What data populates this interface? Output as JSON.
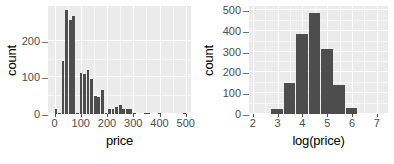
{
  "chart_data": [
    {
      "type": "bar",
      "title": "",
      "xlabel": "price",
      "ylabel": "count",
      "xlim": [
        -25,
        520
      ],
      "ylim": [
        0,
        295
      ],
      "xticks": [
        0,
        100,
        200,
        300,
        400,
        500
      ],
      "yticks": [
        0,
        100,
        200
      ],
      "grid": true,
      "bin_width": 13.6,
      "bin_starts": [
        0,
        13.6,
        27.2,
        40.8,
        54.4,
        68,
        81.6,
        95.2,
        108.8,
        122.4,
        136,
        149.6,
        163.2,
        176.8,
        190.4,
        204,
        217.6,
        231.2,
        244.8,
        258.4,
        272,
        285.6,
        299.2,
        340,
        353.6,
        394,
        489.6
      ],
      "categories": [
        "0-14",
        "14-27",
        "27-41",
        "41-54",
        "54-68",
        "68-82",
        "82-95",
        "95-109",
        "109-122",
        "122-136",
        "136-150",
        "150-163",
        "163-177",
        "177-190",
        "190-204",
        "204-218",
        "218-231",
        "231-245",
        "245-258",
        "258-272",
        "272-286",
        "286-299",
        "299-313",
        "340-354",
        "354-367",
        "394-408",
        "490-503"
      ],
      "values": [
        14,
        2,
        146,
        283,
        258,
        267,
        4,
        113,
        110,
        121,
        97,
        49,
        47,
        65,
        3,
        15,
        13,
        20,
        24,
        14,
        14,
        13,
        2,
        2,
        2,
        2,
        3
      ]
    },
    {
      "type": "bar",
      "title": "",
      "xlabel": "log(price)",
      "ylabel": "count",
      "xlim": [
        1.85,
        7.45
      ],
      "ylim": [
        0,
        520
      ],
      "xticks": [
        2,
        3,
        4,
        5,
        6,
        7
      ],
      "yticks": [
        0,
        100,
        200,
        300,
        400,
        500
      ],
      "grid": true,
      "bin_width": 0.5,
      "bin_starts": [
        2.75,
        3.25,
        3.75,
        4.25,
        4.75,
        5.25,
        5.75
      ],
      "categories": [
        "2.75-3.25",
        "3.25-3.75",
        "3.75-4.25",
        "4.25-4.75",
        "4.75-5.25",
        "5.25-5.75",
        "5.75-6.25"
      ],
      "values": [
        25,
        148,
        383,
        487,
        315,
        138,
        28
      ]
    }
  ],
  "style": {
    "panel_background": "#ebebeb",
    "grid_color": "#ffffff",
    "bar_color": "#4d4d4d",
    "text_color": "#4d4d4d",
    "title_color": "#000000",
    "page_background": "#ffffff"
  },
  "left_panel": {
    "ylabel": "count",
    "xlabel": "price",
    "ytick_labels": [
      "0",
      "100",
      "200"
    ],
    "xtick_labels": [
      "0",
      "100",
      "200",
      "300",
      "400",
      "500"
    ]
  },
  "right_panel": {
    "ylabel": "count",
    "xlabel": "log(price)",
    "ytick_labels": [
      "0",
      "100",
      "200",
      "300",
      "400",
      "500"
    ],
    "xtick_labels": [
      "2",
      "3",
      "4",
      "5",
      "6",
      "7"
    ]
  }
}
